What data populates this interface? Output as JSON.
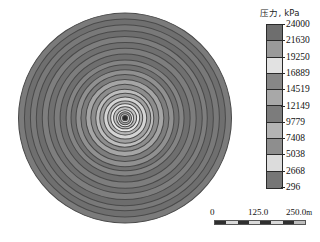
{
  "figure": {
    "kind": "contour-map"
  },
  "legend": {
    "title": "压力, kPa",
    "unit": "kPa",
    "quantity": "压力",
    "labels": [
      "24000",
      "21630",
      "19250",
      "16889",
      "14519",
      "12149",
      "9779",
      "7408",
      "5038",
      "2668",
      "296"
    ],
    "swatch_colors": [
      "#6e6e6e",
      "#9a9a9a",
      "#e2e2e2",
      "#878787",
      "#a8a8a8",
      "#7c7c7c",
      "#b4b4b4",
      "#8e8e8e",
      "#dcdcdc",
      "#767676",
      "#3a3a3a"
    ]
  },
  "scalebar": {
    "ticks": [
      "0",
      "125.0",
      "250.0"
    ],
    "unit": "m",
    "segments": [
      "#2f2f2f",
      "#d9d9d9",
      "#2f2f2f",
      "#d9d9d9",
      "#2f2f2f",
      "#d9d9d9",
      "#2f2f2f",
      "#bdbdbd"
    ]
  },
  "chart_data": {
    "type": "heatmap",
    "title": "压力, kPa",
    "xlabel": "",
    "ylabel": "",
    "colorbar_label": "压力, kPa",
    "grid": false,
    "legend_position": "right",
    "geometry": "radially symmetric, concentric circular isobars about a central well",
    "center": {
      "x": 120,
      "y": 118
    },
    "outer_radius_px": 108,
    "scale_meters_per_unit": {
      "bar_length_m": 250.0,
      "bar_length_px": 92
    },
    "value_range": [
      296,
      24000
    ],
    "contour_levels": [
      296,
      2668,
      5038,
      7408,
      9779,
      12149,
      14519,
      16889,
      19250,
      21630,
      24000
    ],
    "level_step": 2370,
    "rings_outer_to_inner": [
      {
        "radius_px": 108,
        "value": 2668,
        "color": "#7b7b7b"
      },
      {
        "radius_px": 102,
        "value": 2668,
        "color": "#6f6f6f"
      },
      {
        "radius_px": 96,
        "value": 2668,
        "color": "#797979"
      },
      {
        "radius_px": 90,
        "value": 2668,
        "color": "#6d6d6d"
      },
      {
        "radius_px": 84,
        "value": 5038,
        "color": "#7e7e7e"
      },
      {
        "radius_px": 78,
        "value": 5038,
        "color": "#707070"
      },
      {
        "radius_px": 72,
        "value": 5038,
        "color": "#7d7d7d"
      },
      {
        "radius_px": 66,
        "value": 7408,
        "color": "#6f6f6f"
      },
      {
        "radius_px": 60,
        "value": 7408,
        "color": "#848484"
      },
      {
        "radius_px": 55,
        "value": 7408,
        "color": "#727272"
      },
      {
        "radius_px": 50,
        "value": 9779,
        "color": "#909090"
      },
      {
        "radius_px": 45,
        "value": 9779,
        "color": "#7d7d7d"
      },
      {
        "radius_px": 40,
        "value": 12149,
        "color": "#a5a5a5"
      },
      {
        "radius_px": 35,
        "value": 12149,
        "color": "#8d8d8d"
      },
      {
        "radius_px": 30,
        "value": 14519,
        "color": "#bdbdbd"
      },
      {
        "radius_px": 26,
        "value": 14519,
        "color": "#a0a0a0"
      },
      {
        "radius_px": 22,
        "value": 16889,
        "color": "#d4d4d4"
      },
      {
        "radius_px": 18,
        "value": 16889,
        "color": "#b6b6b6"
      },
      {
        "radius_px": 15,
        "value": 19250,
        "color": "#e6e6e6"
      },
      {
        "radius_px": 12,
        "value": 19250,
        "color": "#c2c2c2"
      },
      {
        "radius_px": 9,
        "value": 21630,
        "color": "#ededed"
      },
      {
        "radius_px": 7,
        "value": 21630,
        "color": "#a9a9a9"
      },
      {
        "radius_px": 5,
        "value": 24000,
        "color": "#d0d0d0"
      },
      {
        "radius_px": 3,
        "value": 24000,
        "color": "#2b2b2b"
      }
    ]
  }
}
